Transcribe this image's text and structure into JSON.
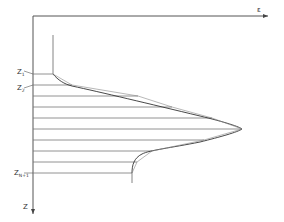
{
  "diagram": {
    "axes": {
      "horizontal_label": "ε",
      "vertical_label": "Z"
    },
    "layer_labels": [
      {
        "main": "Z",
        "sub": "1"
      },
      {
        "main": "Z",
        "sub": "2"
      },
      {
        "main": "Z",
        "sub": "N+1"
      }
    ],
    "layer_count_visible": 10,
    "colors": {
      "line": "#444444",
      "axis": "#555555",
      "background": "#ffffff"
    }
  }
}
